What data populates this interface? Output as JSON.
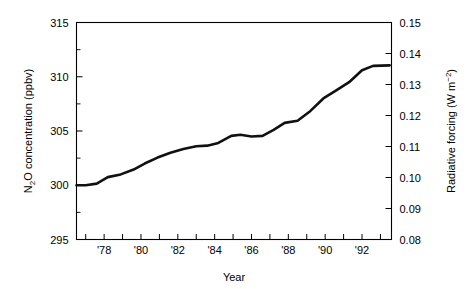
{
  "figure": {
    "background_color": "#ffffff",
    "line_color": "#111111",
    "axis_color": "#000000"
  },
  "labels": {
    "y_left_axis_title": "N2O concentration (ppbv)",
    "y_left_axis_title_parts": {
      "pre": "N",
      "sub": "2",
      "post": "O concentration (ppbv)"
    },
    "y_right_axis_title": "Radiative forcing (W m-2)",
    "y_right_axis_title_parts": {
      "pre": "Radiative forcing (W m",
      "sup": "−2",
      "post": ")"
    },
    "x_axis_title": "Year"
  },
  "ticks": {
    "y_left": [
      "295",
      "300",
      "305",
      "310",
      "315"
    ],
    "y_right": [
      "0.08",
      "0.09",
      "0.10",
      "0.11",
      "0.12",
      "0.13",
      "0.14",
      "0.15"
    ],
    "x": [
      "'78",
      "'80",
      "'82",
      "'84",
      "'86",
      "'88",
      "'90",
      "'92"
    ]
  },
  "chart_data": {
    "type": "line",
    "title": "",
    "xlabel": "Year",
    "ylabel": "N2O concentration (ppbv)",
    "y2label": "Radiative forcing (W m-2)",
    "xlim": [
      1976.5,
      1993.6
    ],
    "ylim": [
      295,
      315
    ],
    "y2lim": [
      0.08,
      0.15
    ],
    "grid": false,
    "legend": "none",
    "x_tick_values": [
      1977,
      1978,
      1979,
      1980,
      1981,
      1982,
      1983,
      1984,
      1985,
      1986,
      1987,
      1988,
      1989,
      1990,
      1991,
      1992,
      1993
    ],
    "x_tick_labels": [
      "",
      "'78",
      "",
      "'80",
      "",
      "'82",
      "",
      "'84",
      "",
      "'86",
      "",
      "'88",
      "",
      "'90",
      "",
      "'92",
      ""
    ],
    "y_tick_values": [
      295,
      300,
      305,
      310,
      315
    ],
    "y_minor_tick_values": [
      297.5,
      302.5,
      307.5,
      312.5
    ],
    "y2_tick_values": [
      0.08,
      0.09,
      0.1,
      0.11,
      0.12,
      0.13,
      0.14,
      0.15
    ],
    "series": [
      {
        "name": "N2O concentration",
        "x": [
          1976.5,
          1977.0,
          1977.6,
          1978.2,
          1978.9,
          1979.6,
          1980.2,
          1980.9,
          1981.6,
          1982.3,
          1983.0,
          1983.6,
          1984.2,
          1984.9,
          1985.4,
          1986.0,
          1986.6,
          1987.2,
          1987.8,
          1988.5,
          1989.2,
          1989.9,
          1990.6,
          1991.3,
          1992.0,
          1992.6,
          1993.5
        ],
        "y": [
          300.0,
          300.0,
          300.15,
          300.75,
          301.0,
          301.45,
          302.0,
          302.55,
          303.0,
          303.35,
          303.6,
          303.65,
          303.9,
          304.55,
          304.65,
          304.5,
          304.55,
          305.1,
          305.75,
          305.95,
          306.85,
          308.0,
          308.75,
          309.5,
          310.6,
          311.0,
          311.05
        ]
      }
    ]
  }
}
